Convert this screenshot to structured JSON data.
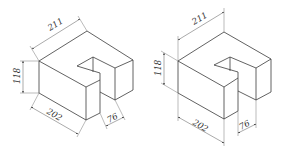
{
  "figures": [
    {
      "id": "left",
      "title": "Isometric view (dimension placement A)",
      "dimensions": {
        "length_top": "211",
        "height": "118",
        "length_bottom": "202",
        "depth": "76"
      }
    },
    {
      "id": "right",
      "title": "Isometric view (dimension placement B)",
      "dimensions": {
        "length_top": "211",
        "height": "118",
        "length_bottom": "202",
        "depth": "76"
      }
    }
  ],
  "colors": {
    "line": "#3a3a3a",
    "dimension_line": "#555555",
    "background": "#ffffff"
  }
}
